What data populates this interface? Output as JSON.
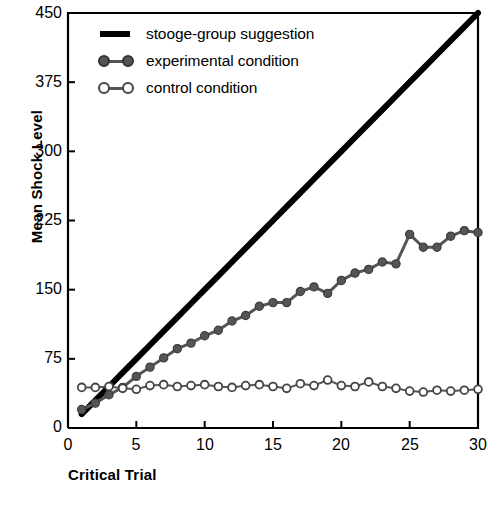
{
  "chart_data": {
    "type": "line",
    "title": "",
    "xlabel": "Critical Trial",
    "ylabel": "Mean Shock Level",
    "xlim": [
      0,
      30
    ],
    "ylim": [
      0,
      450
    ],
    "xticks": [
      0,
      5,
      10,
      15,
      20,
      25,
      30
    ],
    "yticks": [
      0,
      75,
      150,
      225,
      300,
      375,
      450
    ],
    "grid": false,
    "legend_position": "top-left",
    "x": [
      1,
      2,
      3,
      4,
      5,
      6,
      7,
      8,
      9,
      10,
      11,
      12,
      13,
      14,
      15,
      16,
      17,
      18,
      19,
      20,
      21,
      22,
      23,
      24,
      25,
      26,
      27,
      28,
      29,
      30
    ],
    "series": [
      {
        "name": "stooge-group suggestion",
        "marker": "none",
        "color": "#000000",
        "linewidth": 6,
        "values": [
          15,
          30,
          45,
          60,
          75,
          90,
          105,
          120,
          135,
          150,
          165,
          180,
          195,
          210,
          225,
          240,
          255,
          270,
          285,
          300,
          315,
          330,
          345,
          360,
          375,
          390,
          405,
          420,
          435,
          450
        ]
      },
      {
        "name": "experimental condition",
        "marker": "filled-circle",
        "color": "#555555",
        "linewidth": 3,
        "values": [
          20,
          27,
          36,
          44,
          56,
          66,
          76,
          86,
          92,
          100,
          106,
          116,
          122,
          132,
          136,
          136,
          148,
          153,
          146,
          160,
          168,
          172,
          180,
          178,
          210,
          196,
          196,
          208,
          214,
          212
        ]
      },
      {
        "name": "control condition",
        "marker": "open-circle",
        "color": "#555555",
        "linewidth": 2,
        "values": [
          44,
          44,
          45,
          43,
          42,
          46,
          47,
          45,
          46,
          47,
          45,
          44,
          46,
          47,
          45,
          43,
          48,
          46,
          52,
          46,
          45,
          50,
          45,
          43,
          40,
          39,
          41,
          40,
          41,
          42
        ]
      }
    ]
  },
  "legend": {
    "items": [
      {
        "label": "stooge-group suggestion",
        "style": "bar",
        "color": "#000000"
      },
      {
        "label": "experimental condition",
        "style": "filled",
        "color": "#555555"
      },
      {
        "label": "control condition",
        "style": "open",
        "color": "#555555"
      }
    ]
  }
}
